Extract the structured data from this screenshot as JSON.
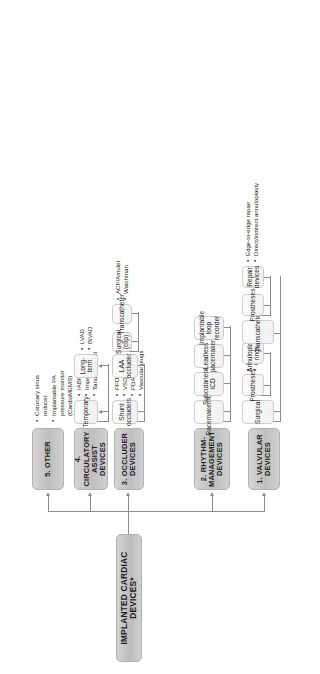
{
  "diagram": {
    "root": {
      "label": "IMPLANTED CARDIAC DEVICES*"
    },
    "categories": [
      {
        "id": "valvular",
        "label": "1. VALVULAR DEVICES",
        "children": [
          {
            "label": "Surgical",
            "children": [
              {
                "label": "Prostheses",
                "bullets": [
                  "Mechanical",
                  "Bioprosthetic"
                ]
              },
              {
                "label": "Annuloplasty rings",
                "bullets": []
              }
            ]
          },
          {
            "label": "Transcatheter",
            "children": [
              {
                "label": "Prostheses",
                "bullets": []
              },
              {
                "label": "Repair devices",
                "bullets": [
                  "Edge-to-edge repair",
                  "Direct/indirect annuloplasty"
                ]
              }
            ]
          }
        ]
      },
      {
        "id": "rhythm",
        "label": "2. RHYTHM-MANAGEMENT DEVICES",
        "children": [
          {
            "label": "Pacemaker/ICD",
            "children": []
          },
          {
            "label": "Subcutaneous ICD",
            "children": []
          },
          {
            "label": "Leadless pacemaker",
            "children": []
          },
          {
            "label": "Implantable loop recorder",
            "children": []
          }
        ]
      },
      {
        "id": "occluder",
        "label": "3. OCCLUDER DEVICES",
        "children": [
          {
            "label": "Shunt occluders",
            "bullets": [
              "PFO/ASD",
              "VSD",
              "PDA",
              "Vascular plugs"
            ],
            "children": []
          },
          {
            "label": "LAA occluder",
            "children": [
              {
                "label": "Surgical (clip)",
                "bullets": []
              },
              {
                "label": "Transcatheter",
                "bullets": [
                  "ACP/Amulet",
                  "Watchman"
                ]
              }
            ]
          }
        ]
      },
      {
        "id": "circulatory",
        "label": "4. CIRCULATORY ASSIST DEVICES",
        "children": [
          {
            "label": "Temporary",
            "bullets": [
              "IABP",
              "Impella",
              "Tandem Heart"
            ],
            "children": []
          },
          {
            "label": "Long-term",
            "bullets": [
              "LVAD",
              "BiVAD"
            ],
            "children": []
          }
        ]
      },
      {
        "id": "other",
        "label": "5. OTHER",
        "bullets": [
          "Coronary sinus reducer",
          "Implantable PA pressure monitor (CardioMEMS)"
        ],
        "children": []
      }
    ]
  },
  "labels": {
    "root": "IMPLANTED CARDIAC DEVICES*",
    "cat1": "1. VALVULAR DEVICES",
    "cat2_line1": "2. RHYTHM-",
    "cat2_line2": "MANAGEMENT DEVICES",
    "cat3": "3. OCCLUDER DEVICES",
    "cat4_line1": "4. CIRCULATORY",
    "cat4_line2": "ASSIST DEVICES",
    "cat5": "5. OTHER",
    "surgical": "Surgical",
    "prostheses_surg": "Prostheses",
    "mechanical": "Mechanical",
    "bioprosthetic": "Bioprosthetic",
    "annuloplasty_rings": "Annuloplasty rings",
    "transcatheter_valve": "Transcatheter",
    "prostheses_tc": "Prostheses",
    "repair_devices": "Repair devices",
    "edge_to_edge": "Edge-to-edge repair",
    "direct_indirect": "Direct/indirect annuloplasty",
    "pacemaker_icd": "Pacemaker/ICD",
    "subcutaneous_icd": "Subcutaneous ICD",
    "leadless_pacemaker": "Leadless pacemaker",
    "loop_recorder": "Implantable loop recorder",
    "shunt_occluders": "Shunt occluders",
    "pfo_asd": "PFO/ASD",
    "vsd": "VSD",
    "pda": "PDA",
    "vascular_plugs": "Vascular plugs",
    "laa_occluder": "LAA occluder",
    "surgical_clip": "Surgical (clip)",
    "transcatheter_laa": "Transcatheter",
    "acp_amulet": "ACP/Amulet",
    "watchman": "Watchman",
    "temporary": "Temporary",
    "iabp": "IABP",
    "impella": "Impella",
    "tandem_heart": "Tandem Heart",
    "longterm": "Long-term",
    "lvad": "LVAD",
    "bivad": "BiVAD",
    "coronary_sinus_1": "Coronary sinus",
    "coronary_sinus_2": "reducer",
    "pa_monitor_1": "Implantable PA",
    "pa_monitor_2": "pressure monitor",
    "pa_monitor_3": "(CardioMEMS)"
  },
  "colors": {
    "box_fill_dark": "#c7c7c7",
    "box_fill_light": "#f5f5f5",
    "line": "#8c8c8c",
    "text": "#1b1b1b"
  }
}
